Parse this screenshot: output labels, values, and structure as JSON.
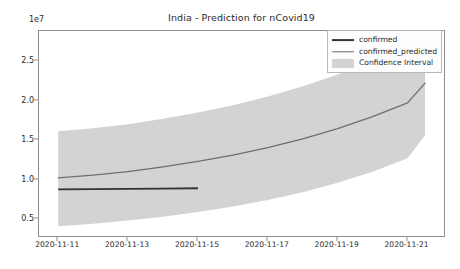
{
  "chart_data": {
    "type": "line",
    "title": "India - Prediction for nCovid19",
    "xlabel": "",
    "ylabel": "",
    "y_offset_label": "1e7",
    "grid": false,
    "legend_position": "upper right",
    "x_ticklabels": [
      "2020-11-11",
      "2020-11-13",
      "2020-11-15",
      "2020-11-17",
      "2020-11-19",
      "2020-11-21"
    ],
    "x_tickvalues": [
      0,
      2,
      4,
      6,
      8,
      10
    ],
    "xlim": [
      -0.55,
      11.1
    ],
    "y_ticklabels": [
      "0.5",
      "1.0",
      "1.5",
      "2.0",
      "2.5"
    ],
    "y_tickvalues": [
      5000000,
      10000000,
      15000000,
      20000000,
      25000000
    ],
    "ylim": [
      2600000,
      28800000
    ],
    "series": [
      {
        "name": "confirmed",
        "color": "#333333",
        "linewidth": 1.8,
        "x": [
          0,
          1,
          2,
          3,
          4
        ],
        "values": [
          8750000,
          8780000,
          8820000,
          8860000,
          8900000
        ]
      },
      {
        "name": "confirmed_predicted",
        "color": "#6e6e6e",
        "linewidth": 1.3,
        "x": [
          0,
          1,
          2,
          3,
          4,
          5,
          6,
          7,
          8,
          9,
          10,
          10.5
        ],
        "values": [
          10200000,
          10550000,
          11000000,
          11600000,
          12300000,
          13100000,
          14050000,
          15150000,
          16450000,
          17950000,
          19700000,
          22200000
        ]
      }
    ],
    "confidence_interval": {
      "name": "Confidence Interval",
      "color": "#d3d3d3",
      "x": [
        0,
        1,
        2,
        3,
        4,
        5,
        6,
        7,
        8,
        9,
        10,
        10.5
      ],
      "lower": [
        4100000,
        4400000,
        4800000,
        5300000,
        5900000,
        6600000,
        7400000,
        8400000,
        9600000,
        11000000,
        12700000,
        15600000
      ],
      "upper": [
        16100000,
        16500000,
        17000000,
        17700000,
        18500000,
        19400000,
        20500000,
        21800000,
        23300000,
        25000000,
        26900000,
        28000000
      ]
    }
  },
  "legend": {
    "items": [
      {
        "label": "confirmed",
        "swatch": "line-confirmed"
      },
      {
        "label": "confirmed_predicted",
        "swatch": "line-predicted"
      },
      {
        "label": "Confidence Interval",
        "swatch": "band"
      }
    ]
  }
}
